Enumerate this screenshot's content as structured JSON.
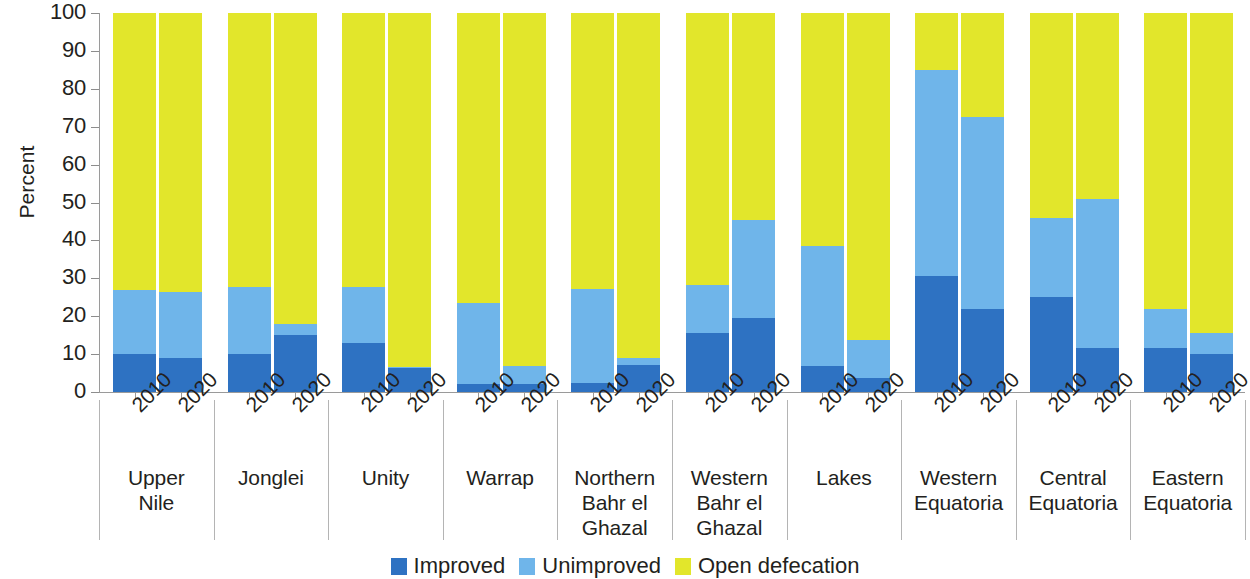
{
  "chart_data": {
    "type": "bar",
    "subtype": "stacked-bar-100-percent-grouped",
    "title": "",
    "xlabel": "",
    "ylabel": "Percent",
    "ylim": [
      0,
      100
    ],
    "yticks": [
      0,
      10,
      20,
      30,
      40,
      50,
      60,
      70,
      80,
      90,
      100
    ],
    "grid": false,
    "legend_position": "bottom-center",
    "legend": [
      "Improved",
      "Unimproved",
      "Open defecation"
    ],
    "series": [
      {
        "name": "Improved",
        "color": "#2e72c2",
        "values": [
          10,
          9,
          10,
          15,
          13,
          6.3,
          2,
          2,
          2.5,
          7,
          15.5,
          19.5,
          6.8,
          3.7,
          30.5,
          22,
          25,
          11.5,
          11.5,
          10
        ]
      },
      {
        "name": "Unimproved",
        "color": "#6fb5ea",
        "values": [
          16.8,
          17.4,
          17.6,
          3,
          14.8,
          0.3,
          21.5,
          4.8,
          24.8,
          1.9,
          12.7,
          26,
          31.8,
          10,
          54.5,
          50.5,
          21,
          39.5,
          10.5,
          5.5
        ]
      },
      {
        "name": "Open defecation",
        "color": "#e2e62b",
        "values": [
          73.2,
          73.6,
          72.4,
          82,
          72.2,
          93.4,
          76.5,
          93.2,
          72.7,
          91.1,
          71.8,
          54.5,
          61.4,
          86.3,
          15,
          27.5,
          54,
          49,
          78,
          84.5
        ]
      }
    ],
    "groups": [
      {
        "label": "Upper\nNile",
        "years": [
          "2010",
          "2020"
        ]
      },
      {
        "label": "Jonglei",
        "years": [
          "2010",
          "2020"
        ]
      },
      {
        "label": "Unity",
        "years": [
          "2010",
          "2020"
        ]
      },
      {
        "label": "Warrap",
        "years": [
          "2010",
          "2020"
        ]
      },
      {
        "label": "Northern\nBahr el\nGhazal",
        "years": [
          "2010",
          "2020"
        ]
      },
      {
        "label": "Western\nBahr el\nGhazal",
        "years": [
          "2010",
          "2020"
        ]
      },
      {
        "label": "Lakes",
        "years": [
          "2010",
          "2020"
        ]
      },
      {
        "label": "Western\nEquatoria",
        "years": [
          "2010",
          "2020"
        ]
      },
      {
        "label": "Central\nEquatoria",
        "years": [
          "2010",
          "2020"
        ]
      },
      {
        "label": "Eastern\nEquatoria",
        "years": [
          "2010",
          "2020"
        ]
      }
    ],
    "bars": [
      {
        "group": "Upper Nile",
        "year": "2010",
        "improved": 10,
        "unimproved": 16.8,
        "open_defecation": 73.2
      },
      {
        "group": "Upper Nile",
        "year": "2020",
        "improved": 9,
        "unimproved": 17.4,
        "open_defecation": 73.6
      },
      {
        "group": "Jonglei",
        "year": "2010",
        "improved": 10,
        "unimproved": 17.6,
        "open_defecation": 72.4
      },
      {
        "group": "Jonglei",
        "year": "2020",
        "improved": 15,
        "unimproved": 3,
        "open_defecation": 82
      },
      {
        "group": "Unity",
        "year": "2010",
        "improved": 13,
        "unimproved": 14.8,
        "open_defecation": 72.2
      },
      {
        "group": "Unity",
        "year": "2020",
        "improved": 6.3,
        "unimproved": 0.3,
        "open_defecation": 93.4
      },
      {
        "group": "Warrap",
        "year": "2010",
        "improved": 2,
        "unimproved": 21.5,
        "open_defecation": 76.5
      },
      {
        "group": "Warrap",
        "year": "2020",
        "improved": 2,
        "unimproved": 4.8,
        "open_defecation": 93.2
      },
      {
        "group": "Northern Bahr el Ghazal",
        "year": "2010",
        "improved": 2.5,
        "unimproved": 24.8,
        "open_defecation": 72.7
      },
      {
        "group": "Northern Bahr el Ghazal",
        "year": "2020",
        "improved": 7,
        "unimproved": 1.9,
        "open_defecation": 91.1
      },
      {
        "group": "Western Bahr el Ghazal",
        "year": "2010",
        "improved": 15.5,
        "unimproved": 12.7,
        "open_defecation": 71.8
      },
      {
        "group": "Western Bahr el Ghazal",
        "year": "2020",
        "improved": 19.5,
        "unimproved": 26,
        "open_defecation": 54.5
      },
      {
        "group": "Lakes",
        "year": "2010",
        "improved": 6.8,
        "unimproved": 31.8,
        "open_defecation": 61.4
      },
      {
        "group": "Lakes",
        "year": "2020",
        "improved": 3.7,
        "unimproved": 10,
        "open_defecation": 86.3
      },
      {
        "group": "Western Equatoria",
        "year": "2010",
        "improved": 30.5,
        "unimproved": 54.5,
        "open_defecation": 15
      },
      {
        "group": "Western Equatoria",
        "year": "2020",
        "improved": 22,
        "unimproved": 50.5,
        "open_defecation": 27.5
      },
      {
        "group": "Central Equatoria",
        "year": "2010",
        "improved": 25,
        "unimproved": 21,
        "open_defecation": 54
      },
      {
        "group": "Central Equatoria",
        "year": "2020",
        "improved": 11.5,
        "unimproved": 39.5,
        "open_defecation": 49
      },
      {
        "group": "Eastern Equatoria",
        "year": "2010",
        "improved": 11.5,
        "unimproved": 10.5,
        "open_defecation": 78
      },
      {
        "group": "Eastern Equatoria",
        "year": "2020",
        "improved": 10,
        "unimproved": 5.5,
        "open_defecation": 84.5
      }
    ]
  }
}
